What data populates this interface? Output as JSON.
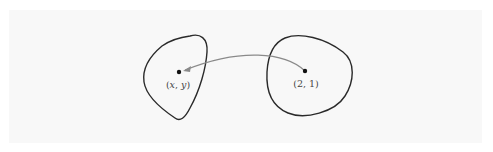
{
  "diagram": {
    "type": "mapping",
    "colors": {
      "background": "#ffffff",
      "panel": "#f8f8f8",
      "outline": "#2a2a2a",
      "arrow": "#8a8a8a",
      "point": "#111111",
      "label": "#444444"
    },
    "regions": [
      {
        "id": "left-region",
        "point_label": "(x, y)",
        "label_x": "x",
        "label_y": "y"
      },
      {
        "id": "right-region",
        "point_label": "(2, 1)"
      }
    ],
    "arrow": {
      "from": "(2, 1)",
      "to": "(x, y)"
    }
  }
}
